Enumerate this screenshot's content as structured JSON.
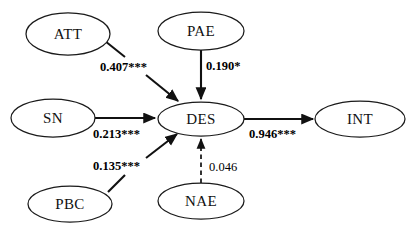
{
  "diagram": {
    "type": "path-diagram",
    "background_color": "#ffffff",
    "line_color": "#111111",
    "node_fill": "#ffffff",
    "nodes": [
      {
        "id": "ATT",
        "label": "ATT",
        "cx": 68,
        "cy": 34,
        "rx": 42,
        "ry": 21
      },
      {
        "id": "PAE",
        "label": "PAE",
        "cx": 201,
        "cy": 31,
        "rx": 43,
        "ry": 19
      },
      {
        "id": "SN",
        "label": "SN",
        "cx": 53,
        "cy": 118,
        "rx": 42,
        "ry": 19
      },
      {
        "id": "DES",
        "label": "DES",
        "cx": 201,
        "cy": 119,
        "rx": 43,
        "ry": 17
      },
      {
        "id": "INT",
        "label": "INT",
        "cx": 360,
        "cy": 119,
        "rx": 45,
        "ry": 18
      },
      {
        "id": "PBC",
        "label": "PBC",
        "cx": 70,
        "cy": 204,
        "rx": 42,
        "ry": 18
      },
      {
        "id": "NAE",
        "label": "NAE",
        "cx": 201,
        "cy": 201,
        "rx": 43,
        "ry": 18
      }
    ],
    "edges": [
      {
        "id": "att-des",
        "from": "ATT",
        "to": "DES",
        "coefficient": "0.407***",
        "style": "solid",
        "bold": true,
        "label_x": 99,
        "label_y": 61
      },
      {
        "id": "pae-des",
        "from": "PAE",
        "to": "DES",
        "coefficient": "0.190*",
        "style": "solid",
        "bold": true,
        "label_x": 205,
        "label_y": 60
      },
      {
        "id": "sn-des",
        "from": "SN",
        "to": "DES",
        "coefficient": "0.213***",
        "style": "solid",
        "bold": true,
        "label_x": 92,
        "label_y": 128
      },
      {
        "id": "pbc-des",
        "from": "PBC",
        "to": "DES",
        "coefficient": "0.135***",
        "style": "solid",
        "bold": true,
        "label_x": 92,
        "label_y": 160
      },
      {
        "id": "nae-des",
        "from": "NAE",
        "to": "DES",
        "coefficient": "0.046",
        "style": "dashed",
        "bold": false,
        "label_x": 208,
        "label_y": 161
      },
      {
        "id": "des-int",
        "from": "DES",
        "to": "INT",
        "coefficient": "0.946***",
        "style": "solid",
        "bold": true,
        "label_x": 248,
        "label_y": 128
      }
    ],
    "significance_note": {
      "three_star": "***",
      "one_star": "*"
    }
  }
}
